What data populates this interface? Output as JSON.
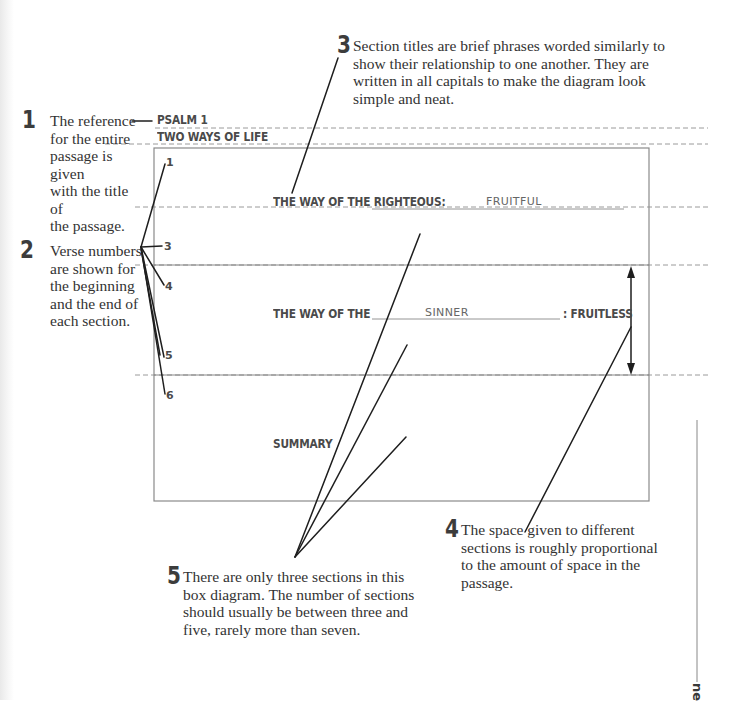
{
  "annotations": [
    {
      "number": "1",
      "text": "The reference for the entire passage is given with the title of the passage.",
      "lines": [
        "The reference",
        "for the entire",
        "passage is given",
        "with the title of",
        "the passage."
      ]
    },
    {
      "number": "2",
      "text": "Verse numbers are shown for the beginning and the end of each section.",
      "lines": [
        "Verse numbers",
        "are shown for",
        "the beginning",
        "and the end of",
        "each section."
      ]
    },
    {
      "number": "3",
      "text": "Section titles are brief phrases worded similarly to show their relationship to one another. They are written in all capitals to make the diagram look simple and neat.",
      "lines": [
        "Section titles are brief phrases worded similarly to",
        "show their relationship to one another. They are",
        "written in all capitals to make the diagram look",
        "simple and neat."
      ]
    },
    {
      "number": "4",
      "text": "The space given to different sections is roughly proportional to the amount of space in the passage.",
      "lines": [
        "The space given to different",
        "sections is roughly proportional",
        "to the amount of space in the",
        "passage."
      ]
    },
    {
      "number": "5",
      "text": "There are only three sections in this box diagram. The number of sections should usually be between three and five, rarely more than seven.",
      "lines": [
        "There are only three sections in this",
        "box diagram. The number of sections",
        "should usually be between three and",
        "five, rarely more than seven."
      ]
    }
  ],
  "diagram": {
    "reference": "PSALM 1",
    "title": "TWO WAYS OF LIFE",
    "sections": [
      {
        "label": "THE WAY OF THE RIGHTEOUS:",
        "fill_in": "FRUITFUL",
        "suffix": "",
        "start_verse": "1",
        "end_verse": "3"
      },
      {
        "label": "THE WAY OF THE",
        "fill_in": "SINNER",
        "suffix": ": FRUITLESS",
        "start_verse": "4",
        "end_verse": "5"
      },
      {
        "label": "SUMMARY",
        "fill_in": "",
        "suffix": "",
        "start_verse": "6",
        "end_verse": ""
      }
    ]
  },
  "margin_text": "ne",
  "colors": {
    "line": "#1e1e1e",
    "box": "#8a8a8a",
    "dash": "#9a9a9a",
    "text": "#333333"
  }
}
